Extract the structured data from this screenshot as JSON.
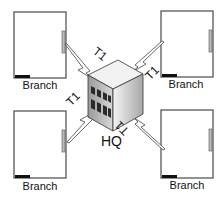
{
  "diagram": {
    "type": "network-topology",
    "hub": {
      "label": "HQ",
      "link_label": "T1"
    },
    "branches": [
      {
        "position": "top-left",
        "label": "Branch",
        "link_label": "T1"
      },
      {
        "position": "top-right",
        "label": "Branch",
        "link_label": "T1"
      },
      {
        "position": "bottom-left",
        "label": "Branch",
        "link_label": "T1"
      },
      {
        "position": "bottom-right",
        "label": "Branch",
        "link_label": "T1"
      }
    ],
    "colors": {
      "line": "#3a3a3a",
      "building_light": "#e8e8e8",
      "building_dark": "#8a8a8a",
      "window": "#2a2a2a"
    }
  }
}
